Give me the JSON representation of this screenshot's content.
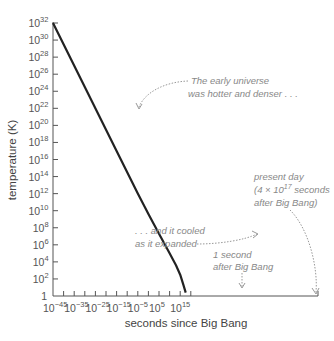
{
  "chart_data": {
    "type": "line",
    "title": "",
    "xlabel": "seconds since Big Bang",
    "ylabel": "temperature (K)",
    "xscale": "log",
    "yscale": "log",
    "xlim_exp": [
      -45,
      17.6
    ],
    "ylim_exp": [
      0,
      32
    ],
    "x_ticks": [
      "10^-45",
      "10^-35",
      "10^-25",
      "10^-15",
      "10^-5",
      "10^5",
      "10^15"
    ],
    "x_tick_exps": [
      -45,
      -35,
      -25,
      -15,
      -5,
      5,
      15
    ],
    "y_ticks": [
      "1",
      "10^2",
      "10^4",
      "10^6",
      "10^8",
      "10^10",
      "10^12",
      "10^14",
      "10^16",
      "10^18",
      "10^20",
      "10^22",
      "10^24",
      "10^26",
      "10^28",
      "10^30",
      "10^32"
    ],
    "y_tick_exps": [
      0,
      2,
      4,
      6,
      8,
      10,
      12,
      14,
      16,
      18,
      20,
      22,
      24,
      26,
      28,
      30,
      32
    ],
    "grid": false,
    "legend": null,
    "series": [
      {
        "name": "temperature",
        "x_exp": [
          -45,
          -30,
          -15,
          -5,
          0,
          5,
          10,
          13,
          15,
          16.5,
          17.6
        ],
        "y_exp": [
          32,
          24.5,
          17,
          12,
          9.6,
          7.3,
          5,
          3.6,
          2.5,
          1.3,
          0.4
        ]
      }
    ],
    "annotations": [
      {
        "text": [
          "The early universe",
          "was hotter and denser . . ."
        ],
        "points_to_exp": [
          -25,
          22
        ]
      },
      {
        "text": [
          ". . . and it cooled",
          "as it expanded"
        ],
        "points_to_exp": [
          7,
          6.5
        ]
      },
      {
        "text": [
          "1 second",
          "after Big Bang"
        ],
        "points_to_exp": [
          0,
          0
        ]
      },
      {
        "text": [
          "present day",
          "(4 × 10^17 seconds",
          "after Big Bang)"
        ],
        "points_to_exp": [
          17.6,
          0.4
        ]
      }
    ]
  },
  "labels": {
    "xlabel": "seconds since Big Bang",
    "ylabel": "temperature (K)",
    "x_ticks": [
      {
        "base": "10",
        "exp": "−45"
      },
      {
        "base": "10",
        "exp": "−35"
      },
      {
        "base": "10",
        "exp": "−25"
      },
      {
        "base": "10",
        "exp": "−15"
      },
      {
        "base": "10",
        "exp": "−5"
      },
      {
        "base": "10",
        "exp": "5"
      },
      {
        "base": "10",
        "exp": "15"
      }
    ],
    "y_ticks": [
      {
        "base": "1",
        "exp": ""
      },
      {
        "base": "10",
        "exp": "2"
      },
      {
        "base": "10",
        "exp": "4"
      },
      {
        "base": "10",
        "exp": "6"
      },
      {
        "base": "10",
        "exp": "8"
      },
      {
        "base": "10",
        "exp": "10"
      },
      {
        "base": "10",
        "exp": "12"
      },
      {
        "base": "10",
        "exp": "14"
      },
      {
        "base": "10",
        "exp": "16"
      },
      {
        "base": "10",
        "exp": "18"
      },
      {
        "base": "10",
        "exp": "20"
      },
      {
        "base": "10",
        "exp": "22"
      },
      {
        "base": "10",
        "exp": "24"
      },
      {
        "base": "10",
        "exp": "26"
      },
      {
        "base": "10",
        "exp": "28"
      },
      {
        "base": "10",
        "exp": "30"
      },
      {
        "base": "10",
        "exp": "32"
      }
    ],
    "annot_early_1": "The early universe",
    "annot_early_2": "was hotter and denser . . .",
    "annot_cooled_1": ". . . and it cooled",
    "annot_cooled_2": "as it expanded",
    "annot_second_1": "1 second",
    "annot_second_2": "after Big Bang",
    "annot_present_1": "present day",
    "annot_present_2a": "(4 × 10",
    "annot_present_2exp": "17",
    "annot_present_2b": " seconds",
    "annot_present_3": "after Big Bang)"
  },
  "colors": {
    "curve": "#222222",
    "axis": "#555555",
    "annotation": "#888888"
  }
}
